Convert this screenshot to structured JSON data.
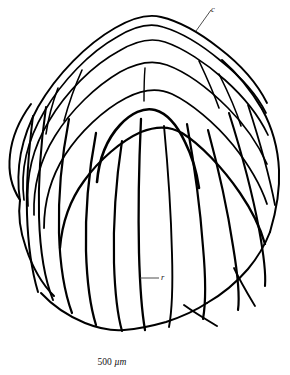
{
  "figure": {
    "kind": "scientific-line-drawing",
    "background_color": "#ffffff",
    "ink_color": "#000000",
    "width": 290,
    "height": 375
  },
  "labels": {
    "concentric": {
      "text": "c",
      "meaning": "concentric growth lines",
      "x": 215,
      "y": 11,
      "leader_from_x": 196,
      "leader_from_y": 31,
      "leader_to_x": 211,
      "leader_to_y": 10
    },
    "radial": {
      "text": "r",
      "meaning": "radial rib",
      "x": 164,
      "y": 278,
      "leader_from_x": 140,
      "leader_from_y": 278,
      "leader_to_x": 159,
      "leader_to_y": 278
    }
  },
  "scale": {
    "value": "500",
    "unit": "µm",
    "full_text": "500 µm",
    "x": 112,
    "y": 364
  },
  "drawing": {
    "outline_color": "#000000",
    "outline_width": 1.9,
    "concentric_line_count": 6,
    "radial_rib_count": 13,
    "outline_path": "M 27,176 C 25,148 30,126 40,108 C 54,82 80,54 106,38 C 124,27 141,22 152,24 C 166,26 186,34 205,47 C 228,62 248,82 259,102 C 270,122 274,148 272,172 C 270,200 260,232 245,258 C 232,281 213,302 194,315 C 175,328 152,334 131,331 C 108,328 84,316 66,299 C 48,282 36,258 31,232 C 27,212 27,193 27,176 Z",
    "concentric_arcs": [
      "M 20,200 C 16,166 23,135 38,107 C 56,74 86,44 114,28 C 133,18 148,15 160,18 C 176,22 197,33 216,47",
      "M 23,199 C 20,167 27,137 42,110 C 60,79 88,50 114,35 C 133,24 149,21 161,24 C 177,28 199,40 218,55",
      "M 27,203 C 25,172 32,143 47,117 C 64,88 92,61 117,46 C 135,35 151,32 163,36 C 180,41 202,54 222,70",
      "M 32,210 C 31,180 38,152 52,128 C 69,101 95,76 119,62 C 137,51 153,49 165,53 C 183,59 206,74 226,92",
      "M 40,222 C 40,194 47,168 61,146 C 77,121 101,99 124,86 C 141,76 157,75 169,80 C 188,88 212,106 232,127",
      "M 53,240 C 55,215 63,192 77,173 C 93,152 116,134 137,124 C 152,117 167,117 179,124 C 198,135 221,158 239,182"
    ],
    "radial_ribs": [
      "M 141,66 C 140,78 140,90 140,100",
      "M 38,119 C 35,150 33,183 33,214 C 33,244 36,272 41,293",
      "M 62,112 C 57,148 55,187 56,224 C 57,259 62,288 69,311",
      "M 93,128 C 87,165 84,205 85,245 C 86,278 90,305 95,324",
      "M 120,138 C 114,178 112,220 113,262 C 114,295 117,318 121,332",
      "M 141,116 C 139,160 138,206 139,252 C 140,288 142,312 145,330",
      "M 163,126 C 167,168 170,212 171,256 C 172,290 171,313 168,330",
      "M 186,124 C 193,164 199,206 202,248 C 205,281 205,303 202,320",
      "M 206,128 C 216,166 225,205 231,245 C 236,276 238,296 236,310",
      "M 227,112 C 239,150 250,190 257,228 C 262,255 264,273 263,284",
      "M 246,104 C 258,138 268,172 274,203",
      "M 180,306 C 192,314 204,321 214,327",
      "M 232,266 C 240,281 248,295 254,306"
    ],
    "bottom_margin_path": "M 41,293 C 62,310 88,323 118,330 C 148,337 178,333 203,320 C 228,307 248,288 262,266"
  }
}
